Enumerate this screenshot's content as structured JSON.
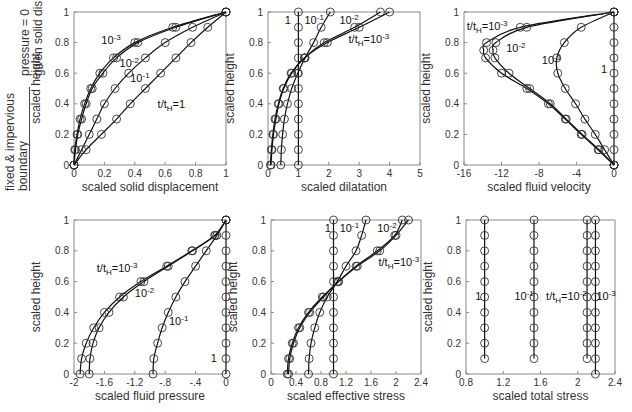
{
  "boundary_legend": {
    "bottom_line1": "fixed & impervious",
    "bottom_line2": "boundary",
    "top_line1": "pressure = 0",
    "top_line2": "given solid disp."
  },
  "chart_data": [
    {
      "type": "line",
      "id": "p1",
      "xlabel": "scaled solid displacement",
      "ylabel": "scaled height",
      "xlim": [
        0,
        1
      ],
      "ylim": [
        0,
        1
      ],
      "xticks": [
        0,
        0.2,
        0.4,
        0.6,
        0.8,
        1
      ],
      "yticks": [
        0,
        0.2,
        0.4,
        0.6,
        0.8,
        1
      ],
      "frame": {
        "x": 74,
        "y": 12,
        "w": 152,
        "h": 153
      },
      "series": [
        {
          "name": "10^-3",
          "y": [
            0,
            0.1,
            0.2,
            0.3,
            0.4,
            0.5,
            0.6,
            0.7,
            0.8,
            0.9,
            1
          ],
          "x": [
            0,
            0.005,
            0.02,
            0.04,
            0.07,
            0.11,
            0.17,
            0.26,
            0.4,
            0.65,
            1
          ]
        },
        {
          "name": "10^-2",
          "y": [
            0,
            0.1,
            0.2,
            0.3,
            0.4,
            0.5,
            0.6,
            0.7,
            0.8,
            0.9,
            1
          ],
          "x": [
            0,
            0.01,
            0.025,
            0.05,
            0.08,
            0.12,
            0.19,
            0.28,
            0.42,
            0.67,
            1
          ]
        },
        {
          "name": "10^-1",
          "y": [
            0,
            0.1,
            0.2,
            0.3,
            0.4,
            0.5,
            0.6,
            0.7,
            0.8,
            0.9,
            1
          ],
          "x": [
            0,
            0.05,
            0.1,
            0.15,
            0.2,
            0.27,
            0.36,
            0.47,
            0.6,
            0.78,
            1
          ]
        },
        {
          "name": "t/tH=1",
          "y": [
            0,
            0.1,
            0.2,
            0.3,
            0.4,
            0.5,
            0.6,
            0.7,
            0.8,
            0.9,
            1
          ],
          "x": [
            0,
            0.08,
            0.18,
            0.28,
            0.37,
            0.47,
            0.57,
            0.67,
            0.77,
            0.88,
            1
          ]
        }
      ],
      "annotations": [
        {
          "text": "10",
          "sup": "-3",
          "x": 0.18,
          "y": 0.79
        },
        {
          "text": "10",
          "sup": "-2",
          "x": 0.3,
          "y": 0.64
        },
        {
          "text": "10",
          "sup": "-1",
          "x": 0.37,
          "y": 0.54
        },
        {
          "text": "t/t",
          "sub": "H",
          "tail": "=1",
          "x": 0.55,
          "y": 0.37
        }
      ]
    },
    {
      "type": "line",
      "id": "p2",
      "xlabel": "scaled dilatation",
      "ylabel": "scaled height",
      "xlim": [
        0,
        5
      ],
      "ylim": [
        0,
        1
      ],
      "xticks": [
        0,
        1,
        2,
        3,
        4,
        5
      ],
      "yticks": [
        0,
        0.2,
        0.4,
        0.6,
        0.8,
        1
      ],
      "frame": {
        "x": 268,
        "y": 12,
        "w": 152,
        "h": 153
      },
      "series": [
        {
          "name": "1",
          "y": [
            0,
            0.1,
            0.2,
            0.3,
            0.4,
            0.5,
            0.6,
            0.7,
            0.8,
            0.9,
            1
          ],
          "x": [
            1,
            1,
            1,
            1,
            1,
            1,
            1,
            1,
            1,
            1,
            1
          ]
        },
        {
          "name": "10^-1",
          "y": [
            0,
            0.1,
            0.2,
            0.3,
            0.4,
            0.5,
            0.6,
            0.7,
            0.8,
            0.9,
            1
          ],
          "x": [
            0.42,
            0.44,
            0.48,
            0.54,
            0.64,
            0.78,
            0.98,
            1.22,
            1.5,
            1.75,
            2.05
          ]
        },
        {
          "name": "10^-2",
          "y": [
            0,
            0.1,
            0.2,
            0.3,
            0.4,
            0.5,
            0.6,
            0.7,
            0.8,
            0.9,
            1
          ],
          "x": [
            0.1,
            0.13,
            0.18,
            0.26,
            0.36,
            0.52,
            0.78,
            1.2,
            1.85,
            2.85,
            3.7
          ]
        },
        {
          "name": "t/tH=10^-3",
          "y": [
            0,
            0.1,
            0.2,
            0.3,
            0.4,
            0.5,
            0.6,
            0.7,
            0.8,
            0.9,
            1
          ],
          "x": [
            0.08,
            0.11,
            0.16,
            0.23,
            0.34,
            0.5,
            0.76,
            1.2,
            1.95,
            3.0,
            4.0
          ]
        }
      ],
      "annotations": [
        {
          "text": "1",
          "x": 0.55,
          "y": 0.92
        },
        {
          "text": "10",
          "sup": "-1",
          "x": 1.2,
          "y": 0.92
        },
        {
          "text": "10",
          "sup": "-2",
          "x": 2.35,
          "y": 0.92
        },
        {
          "text": "t/t",
          "sub": "H",
          "tail": "=10",
          "sup2": "-3",
          "x": 2.65,
          "y": 0.8
        }
      ]
    },
    {
      "type": "line",
      "id": "p3",
      "xlabel": "scaled fluid velocity",
      "ylabel": "scaled height",
      "xlim": [
        -16,
        0
      ],
      "ylim": [
        0,
        1
      ],
      "xticks": [
        -16,
        -12,
        -8,
        -4,
        0
      ],
      "yticks": [
        0,
        0.2,
        0.4,
        0.6,
        0.8,
        1
      ],
      "no_right_frame": true,
      "frame": {
        "x": 464,
        "y": 12,
        "w": 150,
        "h": 153
      },
      "series": [
        {
          "name": "t/tH=10^-3",
          "y": [
            0,
            0.1,
            0.2,
            0.3,
            0.4,
            0.5,
            0.6,
            0.7,
            0.75,
            0.8,
            0.9,
            1
          ],
          "x": [
            0,
            -1.7,
            -3.5,
            -5.2,
            -7.0,
            -9.3,
            -12.0,
            -13.7,
            -13.9,
            -13.6,
            -10.0,
            0
          ]
        },
        {
          "name": "10^-2",
          "y": [
            0,
            0.1,
            0.2,
            0.3,
            0.4,
            0.5,
            0.6,
            0.7,
            0.75,
            0.8,
            0.9,
            1
          ],
          "x": [
            0,
            -1.6,
            -3.4,
            -5.1,
            -6.8,
            -9.0,
            -11.2,
            -12.7,
            -12.9,
            -12.6,
            -9.3,
            0
          ]
        },
        {
          "name": "10^-1",
          "y": [
            0,
            0.1,
            0.2,
            0.3,
            0.4,
            0.5,
            0.6,
            0.7,
            0.8,
            0.9,
            1
          ],
          "x": [
            0,
            -1.0,
            -2.0,
            -3.1,
            -4.1,
            -5.2,
            -6.0,
            -6.1,
            -5.3,
            -3.5,
            0
          ]
        },
        {
          "name": "1",
          "y": [
            0,
            0.1,
            0.2,
            0.3,
            0.4,
            0.5,
            0.6,
            0.7,
            0.8,
            0.9,
            1
          ],
          "x": [
            0,
            0,
            0,
            0,
            0,
            0,
            0,
            0,
            0,
            0,
            0
          ]
        }
      ],
      "annotations": [
        {
          "text": "t/t",
          "sub": "H",
          "tail": "=10",
          "sup2": "-3",
          "x": -15.7,
          "y": 0.88
        },
        {
          "text": "10",
          "sup": "-2",
          "x": -11.5,
          "y": 0.74
        },
        {
          "text": "10",
          "sup": "-1",
          "x": -7.7,
          "y": 0.66
        },
        {
          "text": "1",
          "x": -1.4,
          "y": 0.6
        }
      ]
    },
    {
      "type": "line",
      "id": "p4",
      "xlabel": "scaled fluid pressure",
      "ylabel": "scaled height",
      "xlim": [
        -2,
        0
      ],
      "ylim": [
        0,
        1
      ],
      "xticks": [
        -2,
        -1.6,
        -1.2,
        -0.8,
        -0.4,
        0
      ],
      "yticks": [
        0,
        0.2,
        0.4,
        0.6,
        0.8,
        1
      ],
      "no_right_frame": true,
      "frame": {
        "x": 74,
        "y": 220,
        "w": 152,
        "h": 154
      },
      "series": [
        {
          "name": "t/tH=10^-3",
          "y": [
            0,
            0.1,
            0.2,
            0.3,
            0.4,
            0.5,
            0.6,
            0.7,
            0.8,
            0.9,
            1
          ],
          "x": [
            -1.92,
            -1.9,
            -1.84,
            -1.74,
            -1.6,
            -1.4,
            -1.12,
            -0.78,
            -0.45,
            -0.15,
            0
          ]
        },
        {
          "name": "10^-2",
          "y": [
            0,
            0.1,
            0.2,
            0.3,
            0.4,
            0.5,
            0.6,
            0.7,
            0.8,
            0.9,
            1
          ],
          "x": [
            -1.8,
            -1.79,
            -1.75,
            -1.67,
            -1.54,
            -1.35,
            -1.08,
            -0.76,
            -0.44,
            -0.14,
            0
          ]
        },
        {
          "name": "10^-1",
          "y": [
            0,
            0.1,
            0.2,
            0.3,
            0.4,
            0.5,
            0.6,
            0.7,
            0.8,
            0.9,
            1
          ],
          "x": [
            -0.96,
            -0.95,
            -0.9,
            -0.84,
            -0.76,
            -0.66,
            -0.54,
            -0.4,
            -0.26,
            -0.12,
            0
          ]
        },
        {
          "name": "1",
          "y": [
            0,
            0.1,
            0.2,
            0.3,
            0.4,
            0.5,
            0.6,
            0.7,
            0.8,
            0.9,
            1
          ],
          "x": [
            0,
            0,
            0,
            0,
            0,
            0,
            0,
            0,
            0,
            0,
            0
          ]
        }
      ],
      "annotations": [
        {
          "text": "t/t",
          "sub": "H",
          "tail": "=10",
          "sup2": "-3",
          "x": -1.7,
          "y": 0.66
        },
        {
          "text": "10",
          "sup": "-2",
          "x": -1.2,
          "y": 0.5
        },
        {
          "text": "10",
          "sup": "-1",
          "x": -0.75,
          "y": 0.32
        },
        {
          "text": "1",
          "x": -0.2,
          "y": 0.08
        }
      ]
    },
    {
      "type": "line",
      "id": "p5",
      "xlabel": "scaled effective stress",
      "ylabel": "scaled height",
      "xlim": [
        0,
        2.4
      ],
      "ylim": [
        0,
        1
      ],
      "xticks": [
        0,
        0.4,
        0.8,
        1.2,
        1.6,
        2,
        2.4
      ],
      "yticks": [
        0,
        0.2,
        0.4,
        0.6,
        0.8,
        1
      ],
      "frame": {
        "x": 271,
        "y": 220,
        "w": 150,
        "h": 154
      },
      "series": [
        {
          "name": "1",
          "y": [
            0,
            0.1,
            0.2,
            0.3,
            0.4,
            0.5,
            0.6,
            0.7,
            0.8,
            0.9,
            1
          ],
          "x": [
            1,
            1,
            1,
            1,
            1,
            1,
            1,
            1,
            1,
            1,
            1
          ]
        },
        {
          "name": "10^-1",
          "y": [
            0,
            0.1,
            0.2,
            0.3,
            0.4,
            0.5,
            0.6,
            0.7,
            0.8,
            0.9,
            1
          ],
          "x": [
            0.6,
            0.61,
            0.64,
            0.7,
            0.78,
            0.9,
            1.06,
            1.2,
            1.36,
            1.45,
            1.52
          ]
        },
        {
          "name": "10^-2",
          "y": [
            0,
            0.1,
            0.2,
            0.3,
            0.4,
            0.5,
            0.6,
            0.7,
            0.8,
            0.9,
            1
          ],
          "x": [
            0.28,
            0.3,
            0.36,
            0.46,
            0.62,
            0.84,
            1.08,
            1.38,
            1.74,
            2.0,
            2.2
          ]
        },
        {
          "name": "t/tH=10^-3",
          "y": [
            0,
            0.1,
            0.2,
            0.3,
            0.4,
            0.5,
            0.6,
            0.7,
            0.8,
            0.9,
            1
          ],
          "x": [
            0.26,
            0.28,
            0.34,
            0.44,
            0.6,
            0.82,
            1.08,
            1.36,
            1.7,
            1.98,
            2.1
          ]
        }
      ],
      "annotations": [
        {
          "text": "1",
          "x": 0.86,
          "y": 0.92
        },
        {
          "text": "10",
          "sup": "-1",
          "x": 1.1,
          "y": 0.92
        },
        {
          "text": "10",
          "sup": "-2",
          "x": 1.7,
          "y": 0.92
        },
        {
          "text": "t/t",
          "sub": "H",
          "tail": "=10",
          "sup2": "-3",
          "x": 1.72,
          "y": 0.7
        }
      ]
    },
    {
      "type": "line",
      "id": "p6",
      "xlabel": "scaled total stress",
      "ylabel": "scaled height",
      "xlim": [
        0.8,
        2.4
      ],
      "ylim": [
        0,
        1
      ],
      "xticks": [
        0.8,
        1.2,
        1.6,
        2,
        2.4
      ],
      "yticks": [
        0,
        0.2,
        0.4,
        0.6,
        0.8,
        1
      ],
      "frame": {
        "x": 466,
        "y": 220,
        "w": 149,
        "h": 154
      },
      "series": [
        {
          "name": "1",
          "y": [
            0.1,
            0.2,
            0.3,
            0.4,
            0.5,
            0.6,
            0.7,
            0.8,
            0.9,
            1
          ],
          "x": [
            1,
            1,
            1,
            1,
            1,
            1,
            1,
            1,
            1,
            1
          ]
        },
        {
          "name": "10^-1",
          "y": [
            0.1,
            0.2,
            0.3,
            0.4,
            0.5,
            0.6,
            0.7,
            0.8,
            0.9,
            1
          ],
          "x": [
            1.53,
            1.53,
            1.53,
            1.53,
            1.53,
            1.53,
            1.53,
            1.53,
            1.53,
            1.53
          ]
        },
        {
          "name": "t/tH=10^-2",
          "y": [
            0.1,
            0.2,
            0.3,
            0.4,
            0.5,
            0.6,
            0.7,
            0.8,
            0.9,
            1
          ],
          "x": [
            2.1,
            2.1,
            2.1,
            2.1,
            2.1,
            2.1,
            2.1,
            2.1,
            2.1,
            2.1
          ]
        },
        {
          "name": "10^-3",
          "y": [
            0,
            0.1,
            0.2,
            0.3,
            0.4,
            0.5,
            0.6,
            0.7,
            0.8,
            0.9,
            1
          ],
          "x": [
            2.19,
            2.19,
            2.19,
            2.19,
            2.19,
            2.19,
            2.19,
            2.19,
            2.19,
            2.19,
            2.19
          ]
        }
      ],
      "annotations": [
        {
          "text": "1",
          "x": 0.9,
          "y": 0.48
        },
        {
          "text": "10",
          "sup": "-1",
          "x": 1.32,
          "y": 0.48
        },
        {
          "text": "t/t",
          "sub": "H",
          "tail": "=10",
          "sup2": "-2",
          "x": 1.66,
          "y": 0.48
        },
        {
          "text": "10",
          "sup": "-3",
          "x": 2.2,
          "y": 0.48
        }
      ]
    }
  ]
}
